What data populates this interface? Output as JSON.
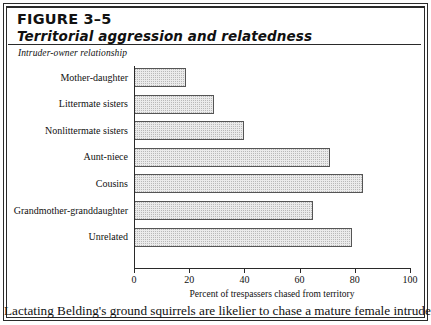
{
  "figure": {
    "number": "FIGURE 3–5",
    "title": "Territorial aggression and relatedness",
    "group_label": "Intruder-owner relationship",
    "caption": "Lactating Belding's ground squirrels are likelier to chase a mature female intruder"
  },
  "chart_data": {
    "type": "bar",
    "orientation": "horizontal",
    "title": "Territorial aggression and relatedness",
    "subtitle": "Intruder-owner relationship",
    "categories": [
      "Mother-daughter",
      "Littermate sisters",
      "Nonlittermate sisters",
      "Aunt-niece",
      "Cousins",
      "Grandmother-granddaughter",
      "Unrelated"
    ],
    "values": [
      19,
      29,
      40,
      71,
      83,
      65,
      79
    ],
    "xlabel": "Percent of trespassers chased from territory",
    "ylabel": "Intruder-owner relationship",
    "xlim": [
      0,
      100
    ],
    "xticks": [
      0,
      20,
      40,
      60,
      80,
      100
    ],
    "xtick_labels": [
      "0",
      "20",
      "40",
      "60",
      "80",
      "100"
    ],
    "grid": false,
    "legend": false,
    "bar_fill": "#ebebeb",
    "bar_edge": "#555555"
  }
}
